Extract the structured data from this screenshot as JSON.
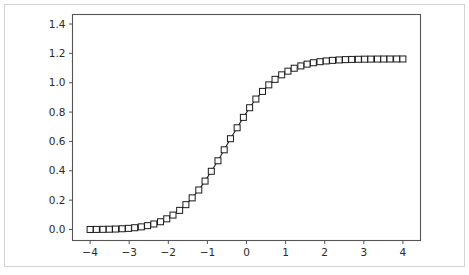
{
  "figure": {
    "background_color": "#ffffff",
    "frame_color": "#d3d3d3",
    "axes_color": "#555555",
    "line_color": "#1a1a1a",
    "marker_face_color": "#ffffff"
  },
  "chart_data": {
    "type": "line",
    "title": "",
    "subtitle": "",
    "xlabel": "",
    "ylabel": "",
    "xlim": [
      -4.45,
      4.45
    ],
    "ylim": [
      -0.075,
      1.465
    ],
    "xticks": [
      -4,
      -3,
      -2,
      -1,
      0,
      1,
      2,
      3,
      4
    ],
    "xticklabels": [
      "−4",
      "−3",
      "−2",
      "−1",
      "0",
      "1",
      "2",
      "3",
      "4"
    ],
    "yticks": [
      0.0,
      0.2,
      0.4,
      0.6,
      0.8,
      1.0,
      1.2,
      1.4
    ],
    "yticklabels": [
      "0.0",
      "0.2",
      "0.4",
      "0.6",
      "0.8",
      "1.0",
      "1.2",
      "1.4"
    ],
    "grid": false,
    "legend": null,
    "marker": "square-open",
    "marker_size": 6,
    "annotations": [],
    "series": [
      {
        "name": "cumulative-curve",
        "x": [
          -4.0,
          -3.84,
          -3.67,
          -3.51,
          -3.35,
          -3.18,
          -3.02,
          -2.86,
          -2.69,
          -2.53,
          -2.37,
          -2.2,
          -2.04,
          -1.88,
          -1.71,
          -1.55,
          -1.39,
          -1.22,
          -1.06,
          -0.9,
          -0.73,
          -0.57,
          -0.41,
          -0.24,
          -0.08,
          0.08,
          0.24,
          0.41,
          0.57,
          0.73,
          0.9,
          1.06,
          1.22,
          1.39,
          1.55,
          1.71,
          1.88,
          2.04,
          2.2,
          2.37,
          2.53,
          2.69,
          2.86,
          3.02,
          3.18,
          3.35,
          3.51,
          3.67,
          3.84,
          4.0
        ],
        "y": [
          0.0003,
          0.0006,
          0.0011,
          0.0019,
          0.0031,
          0.005,
          0.0078,
          0.012,
          0.018,
          0.0262,
          0.0375,
          0.0527,
          0.0727,
          0.0983,
          0.1303,
          0.1692,
          0.2155,
          0.2692,
          0.3298,
          0.3966,
          0.4682,
          0.5429,
          0.6186,
          0.693,
          0.764,
          0.8297,
          0.8889,
          0.9409,
          0.9855,
          1.023,
          1.0539,
          1.0789,
          1.0989,
          1.1146,
          1.1268,
          1.1362,
          1.1433,
          1.1486,
          1.1525,
          1.1554,
          1.1574,
          1.1589,
          1.1599,
          1.1606,
          1.1611,
          1.1614,
          1.1616,
          1.1618,
          1.1619,
          1.1619
        ],
        "y_scaled_max": 1.39,
        "plateau_value": 1.39,
        "midpoint_x": 0.0,
        "midpoint_y": 0.695
      }
    ]
  }
}
